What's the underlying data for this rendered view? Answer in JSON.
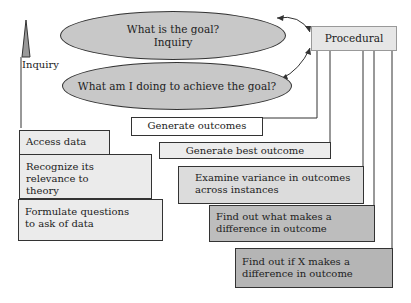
{
  "ellipses": {
    "goal_line1": "What is the goal?",
    "goal_line2": "Inquiry",
    "achieve": "What am I doing to achieve the goal?"
  },
  "procedural": "Procedural",
  "inquiry_label": "Inquiry",
  "left_boxes": [
    {
      "text": "Access data"
    },
    {
      "text": "Recognize its relevance to theory"
    },
    {
      "text": "Formulate questions to ask of data"
    }
  ],
  "right_boxes": [
    {
      "text": "Generate outcomes"
    },
    {
      "text": "Generate best outcome"
    },
    {
      "text": "Examine variance in outcomes across instances"
    },
    {
      "text": "Find out what makes a difference in outcome"
    },
    {
      "text": "Find out if X makes a difference in outcome"
    }
  ],
  "colors": {
    "light": "#ebebeb",
    "mid": "#dcdcdc",
    "dark": "#b8b8b8",
    "ellipse": "#c8c8c8"
  }
}
